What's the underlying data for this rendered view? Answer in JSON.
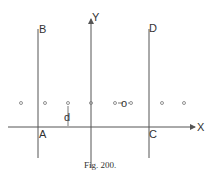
{
  "figure": {
    "caption": "Fig. 200.",
    "labels": {
      "B": "B",
      "D": "D",
      "Y": "Y",
      "X": "X",
      "A": "A",
      "C": "C",
      "d": "d"
    },
    "center_point_label": "o",
    "colors": {
      "line": "#555555",
      "text": "#333333",
      "background": "#ffffff"
    }
  }
}
